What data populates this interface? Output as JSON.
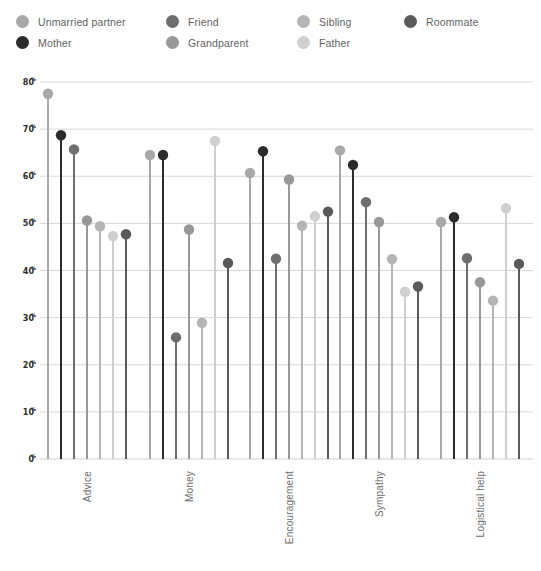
{
  "legend": {
    "columns": [
      [
        {
          "label": "Unmarried partner",
          "color": "#a8a8a8",
          "icon": "legend-dot-icon"
        },
        {
          "label": "Mother",
          "color": "#2b2b2b",
          "icon": "legend-dot-icon"
        }
      ],
      [
        {
          "label": "Friend",
          "color": "#6e6e6e",
          "icon": "legend-dot-icon"
        },
        {
          "label": "Grandparent",
          "color": "#989898",
          "icon": "legend-dot-icon"
        }
      ],
      [
        {
          "label": "Sibling",
          "color": "#b5b5b5",
          "icon": "legend-dot-icon"
        },
        {
          "label": "Father",
          "color": "#cfcfcf",
          "icon": "legend-dot-icon"
        }
      ],
      [
        {
          "label": "Roommate",
          "color": "#5a5a5a",
          "icon": "legend-dot-icon"
        }
      ]
    ]
  },
  "chart_data": {
    "type": "scatter",
    "title": "",
    "subtitle": "",
    "xlabel": "",
    "ylabel": "",
    "categories": [
      "Advice",
      "Money",
      "Encouragement",
      "Sympathy",
      "Logistical help"
    ],
    "ylim": [
      0,
      80
    ],
    "ytick_values": [
      0,
      10,
      20,
      30,
      40,
      50,
      60,
      70,
      80
    ],
    "ytick_labels": [
      "0%",
      "10%",
      "20%",
      "30%",
      "40%",
      "50%",
      "60%",
      "70%",
      "80%"
    ],
    "grid": true,
    "legend_position": "top",
    "marker": "circle-with-stem",
    "series": [
      {
        "name": "Unmarried partner",
        "color": "#a8a8a8",
        "values": [
          77.5,
          64.5,
          60.7,
          65.5,
          50.3
        ]
      },
      {
        "name": "Mother",
        "color": "#2b2b2b",
        "values": [
          68.7,
          64.5,
          65.3,
          62.4,
          51.3
        ]
      },
      {
        "name": "Friend",
        "color": "#6e6e6e",
        "values": [
          65.7,
          25.8,
          42.5,
          54.5,
          42.6
        ]
      },
      {
        "name": "Grandparent",
        "color": "#989898",
        "values": [
          50.6,
          48.7,
          59.3,
          50.3,
          37.5
        ]
      },
      {
        "name": "Sibling",
        "color": "#b5b5b5",
        "values": [
          49.4,
          28.9,
          49.5,
          42.4,
          33.6
        ]
      },
      {
        "name": "Father",
        "color": "#cfcfcf",
        "values": [
          47.3,
          67.5,
          51.5,
          35.5,
          53.2
        ]
      },
      {
        "name": "Roommate",
        "color": "#5a5a5a",
        "values": [
          47.7,
          41.6,
          52.5,
          36.6,
          41.4
        ]
      }
    ]
  }
}
